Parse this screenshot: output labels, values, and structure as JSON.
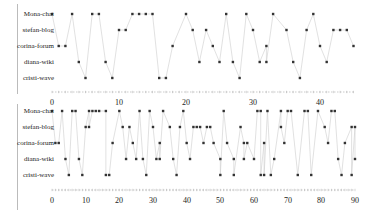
{
  "chart_data": [
    {
      "type": "scatter",
      "title": "",
      "xlabel": "",
      "ylabel": "",
      "xlim": [
        0,
        45
      ],
      "x_ticks": [
        0,
        10,
        20,
        30,
        40
      ],
      "categories": [
        "Mona-chat",
        "stefan-blog",
        "corina-forum",
        "diana-wiki",
        "cristi-wave"
      ],
      "series": [
        {
          "name": "Mona-chat",
          "values": [
            0,
            3,
            6,
            7,
            12,
            13,
            14,
            15,
            20,
            26,
            29,
            33,
            39
          ]
        },
        {
          "name": "stefan-blog",
          "values": [
            10,
            11,
            21,
            23,
            30,
            35,
            38,
            42,
            43,
            44
          ]
        },
        {
          "name": "corina-forum",
          "values": [
            1,
            2,
            18,
            24,
            32,
            40,
            45
          ]
        },
        {
          "name": "diana-wiki",
          "values": [
            4,
            8,
            22,
            25,
            27,
            31,
            32,
            36,
            41
          ]
        },
        {
          "name": "cristi-wave",
          "values": [
            5,
            9,
            16,
            17,
            28,
            37
          ]
        }
      ],
      "sequence_lines": true,
      "grid": false,
      "legend": "none"
    },
    {
      "type": "scatter",
      "title": "",
      "xlabel": "",
      "ylabel": "",
      "xlim": [
        0,
        90
      ],
      "x_ticks": [
        0,
        10,
        20,
        30,
        40,
        50,
        60,
        70,
        80,
        90
      ],
      "categories": [
        "Mona-chat",
        "stefan-blog",
        "corina-forum",
        "diana-wiki",
        "cristi-wave"
      ],
      "series": [
        {
          "name": "Mona-chat",
          "values": [
            0,
            3,
            6,
            7,
            11,
            12,
            13,
            14,
            16,
            20,
            26,
            29,
            33,
            39,
            51,
            61,
            62,
            64,
            68,
            70,
            71,
            75,
            76,
            79,
            83,
            84
          ]
        },
        {
          "name": "stefan-blog",
          "values": [
            10,
            11,
            21,
            23,
            30,
            35,
            38,
            42,
            43,
            44,
            46,
            47,
            56,
            68,
            81,
            89,
            90
          ]
        },
        {
          "name": "corina-forum",
          "values": [
            1,
            2,
            18,
            24,
            32,
            40,
            45,
            48,
            52,
            57,
            58,
            63,
            69,
            82,
            87
          ]
        },
        {
          "name": "diana-wiki",
          "values": [
            4,
            8,
            22,
            25,
            27,
            31,
            32,
            36,
            41,
            50,
            54,
            57,
            60,
            66,
            85,
            90
          ]
        },
        {
          "name": "cristi-wave",
          "values": [
            5,
            9,
            16,
            17,
            28,
            37,
            50,
            54,
            62,
            63,
            65,
            73,
            77,
            86,
            89
          ]
        }
      ],
      "sequence_lines": true,
      "grid": false,
      "legend": "none"
    }
  ],
  "top_chart": {
    "rows": [
      "Mona-chat",
      "stefan-blog",
      "corina-forum",
      "diana-wiki",
      "cristi-wave"
    ],
    "ticks": [
      "0",
      "10",
      "20",
      "30",
      "40"
    ]
  },
  "bottom_chart": {
    "rows": [
      "Mona-chat",
      "stefan-blog",
      "corina-forum",
      "diana-wiki",
      "cristi-wave"
    ],
    "ticks": [
      "0",
      "10",
      "20",
      "30",
      "40",
      "50",
      "60",
      "70",
      "80",
      "90"
    ]
  },
  "colors": {
    "dot": "#333333",
    "line": "#cccccc",
    "axis": "#aaaaaa"
  }
}
